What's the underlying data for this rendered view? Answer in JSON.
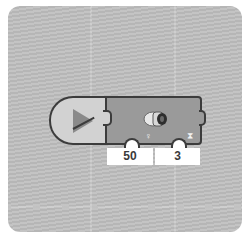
{
  "program": {
    "start_block": {
      "icon": "play-icon"
    },
    "motor_block": {
      "icon": "large-motor-icon",
      "params": [
        {
          "icon": "power-icon",
          "value": "50"
        },
        {
          "icon": "hourglass-icon",
          "value": "3"
        }
      ]
    }
  },
  "colors": {
    "canvas": "#bdbdbd",
    "start_block": "#d2d2d2",
    "motor_block": "#9a9a9a",
    "outline": "#3c3c3c"
  }
}
